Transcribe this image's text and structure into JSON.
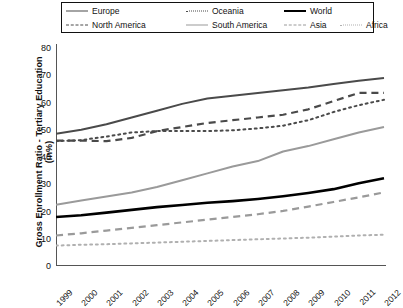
{
  "legend": {
    "items": [
      {
        "label": "Europe",
        "style": "k-solid-dark",
        "name": "legend-item-europe"
      },
      {
        "label": "Oceania",
        "style": "k-dot-dark",
        "name": "legend-item-oceania"
      },
      {
        "label": "World",
        "style": "k-solid-black",
        "name": "legend-item-world"
      },
      {
        "label": "North America",
        "style": "k-dash-dark",
        "name": "legend-item-north-america"
      },
      {
        "label": "South America",
        "style": "k-solid-gray",
        "name": "legend-item-south-america"
      },
      {
        "label": "Asia",
        "style": "k-dash-gray",
        "name": "legend-item-asia"
      },
      {
        "label": "Africa",
        "style": "k-dot-gray",
        "name": "legend-item-africa"
      }
    ]
  },
  "chart_data": {
    "type": "line",
    "title": "",
    "xlabel": "",
    "ylabel": "Gross Enrollment Ratio - Tertiary Education (in%)",
    "xlim": [
      1999,
      2012
    ],
    "ylim": [
      0,
      80
    ],
    "yticks": [
      0,
      10,
      20,
      30,
      40,
      50,
      60,
      70,
      80
    ],
    "grid": false,
    "legend_position": "top",
    "categories": [
      1999,
      2000,
      2001,
      2002,
      2003,
      2004,
      2005,
      2006,
      2007,
      2008,
      2009,
      2010,
      2011,
      2012
    ],
    "x": [
      "1999",
      "2000",
      "2001",
      "2002",
      "2003",
      "2004",
      "2005",
      "2006",
      "2007",
      "2008",
      "2009",
      "2010",
      "2011",
      "2012"
    ],
    "series": [
      {
        "name": "Europe",
        "color": "#4a4a4a",
        "dash": "none",
        "width": 2.0,
        "values": [
          48.5,
          50.0,
          52.0,
          54.5,
          57.0,
          59.5,
          61.5,
          62.5,
          63.5,
          64.5,
          65.5,
          66.8,
          68.0,
          69.0
        ]
      },
      {
        "name": "North America",
        "color": "#4a4a4a",
        "dash": "dash",
        "width": 2.2,
        "values": [
          46.0,
          46.0,
          45.8,
          47.0,
          49.5,
          51.0,
          52.5,
          53.5,
          54.5,
          55.5,
          57.5,
          60.5,
          63.5,
          63.5
        ]
      },
      {
        "name": "Oceania",
        "color": "#4a4a4a",
        "dash": "dot",
        "width": 2.0,
        "values": [
          45.8,
          46.2,
          47.5,
          49.0,
          49.5,
          49.5,
          49.5,
          49.8,
          50.5,
          51.5,
          53.5,
          56.5,
          59.0,
          61.0
        ]
      },
      {
        "name": "South America",
        "color": "#9a9a9a",
        "dash": "none",
        "width": 2.0,
        "values": [
          22.5,
          24.0,
          25.5,
          27.0,
          29.0,
          31.5,
          34.0,
          36.5,
          38.5,
          42.0,
          44.0,
          46.5,
          49.0,
          51.0
        ]
      },
      {
        "name": "World",
        "color": "#000000",
        "dash": "none",
        "width": 2.6,
        "values": [
          18.0,
          18.6,
          19.6,
          20.6,
          21.6,
          22.4,
          23.2,
          23.8,
          24.6,
          25.6,
          26.8,
          28.2,
          30.4,
          32.2
        ]
      },
      {
        "name": "Asia",
        "color": "#9a9a9a",
        "dash": "dash",
        "width": 2.2,
        "values": [
          11.2,
          12.0,
          13.0,
          14.0,
          15.0,
          16.0,
          17.0,
          18.0,
          19.0,
          20.2,
          21.8,
          23.5,
          25.2,
          27.0
        ]
      },
      {
        "name": "Africa",
        "color": "#b0b0b0",
        "dash": "dot",
        "width": 2.0,
        "values": [
          7.5,
          7.8,
          8.0,
          8.3,
          8.6,
          8.9,
          9.2,
          9.5,
          9.8,
          10.1,
          10.4,
          10.8,
          11.2,
          11.5
        ]
      }
    ]
  }
}
